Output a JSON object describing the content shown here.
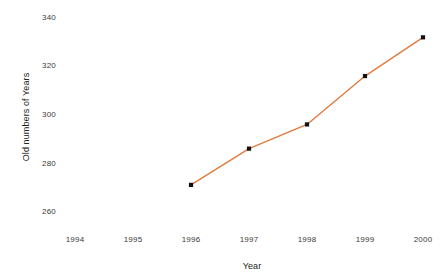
{
  "chart_data": {
    "type": "line",
    "title": "",
    "xlabel": "Year",
    "ylabel": "Old numbers of Years",
    "categories": [
      "1994",
      "1995",
      "1996",
      "1997",
      "1998",
      "1999",
      "2000"
    ],
    "x": [
      1994,
      1995,
      1996,
      1997,
      1998,
      1999,
      2000
    ],
    "values": [
      null,
      null,
      271,
      286,
      296,
      316,
      332
    ],
    "series": [
      {
        "name": "Old numbers of Years",
        "values": [
          null,
          null,
          271,
          286,
          296,
          316,
          332
        ],
        "line_color": "#E07B3C",
        "marker_color": "#111111",
        "marker": "square"
      }
    ],
    "xlim": [
      1993.5,
      2000.5
    ],
    "ylim": [
      255,
      345
    ],
    "yticks": [
      260,
      280,
      300,
      320,
      340
    ],
    "xticks": [
      "1994",
      "1995",
      "1996",
      "1997",
      "1998",
      "1999",
      "2000"
    ],
    "grid": false,
    "legend": false,
    "legend_position": "none",
    "background_color": "#FFFFFF",
    "tick_label_color": "#3A3A3A",
    "axis_title_color": "#222222"
  },
  "axes": {
    "y_title": "Old numbers of Years",
    "x_title": "Year",
    "y_tick_labels": [
      "340",
      "320",
      "300",
      "280",
      "260"
    ],
    "x_tick_labels": [
      "1994",
      "1995",
      "1996",
      "1997",
      "1998",
      "1999",
      "2000"
    ]
  }
}
